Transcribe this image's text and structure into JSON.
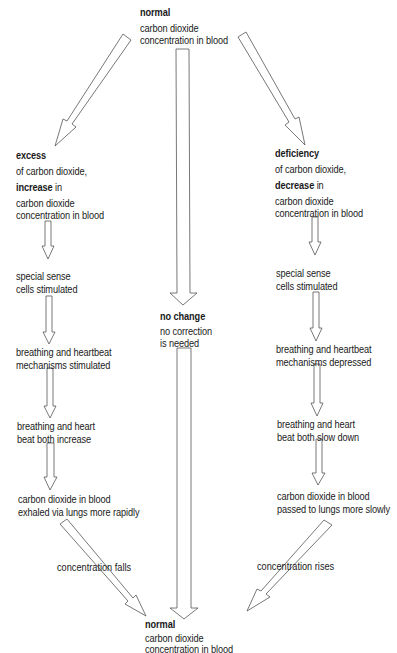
{
  "diagram": {
    "top_node": {
      "title": "normal",
      "lines": [
        "carbon dioxide",
        "concentration in blood"
      ]
    },
    "center_node": {
      "title": "no change",
      "lines": [
        "no correction",
        "is needed"
      ]
    },
    "bottom_node": {
      "title": "normal",
      "lines": [
        "carbon dioxide",
        "concentration in blood"
      ]
    },
    "left_branch": {
      "head": {
        "title": "excess",
        "subtitle": "of carbon dioxide,",
        "emph": "increase",
        "emph_suffix": " in",
        "lines": [
          "carbon dioxide",
          "concentration in blood"
        ]
      },
      "steps": [
        {
          "lines": [
            "special sense",
            "cells stimulated"
          ]
        },
        {
          "lines": [
            "breathing and heartbeat",
            "mechanisms stimulated"
          ]
        },
        {
          "lines": [
            "breathing and heart",
            "beat both increase"
          ]
        },
        {
          "lines": [
            "carbon dioxide in blood",
            "exhaled via lungs more rapidly"
          ]
        }
      ],
      "return_label": "concentration falls"
    },
    "right_branch": {
      "head": {
        "title": "deficiency",
        "subtitle": "of carbon dioxide,",
        "emph": "decrease",
        "emph_suffix": " in",
        "lines": [
          "carbon dioxide",
          "concentration in blood"
        ]
      },
      "steps": [
        {
          "lines": [
            "special sense",
            "cells stimulated"
          ]
        },
        {
          "lines": [
            "breathing and heartbeat",
            "mechanisms depressed"
          ]
        },
        {
          "lines": [
            "breathing and heart",
            "beat both slow down"
          ]
        },
        {
          "lines": [
            "carbon dioxide in blood",
            "passed to lungs more slowly"
          ]
        }
      ],
      "return_label": "concentration rises"
    },
    "colors": {
      "text": "#1a1a1a",
      "arrow_stroke": "#555555",
      "arrow_fill": "#ffffff",
      "background": "#ffffff"
    }
  }
}
